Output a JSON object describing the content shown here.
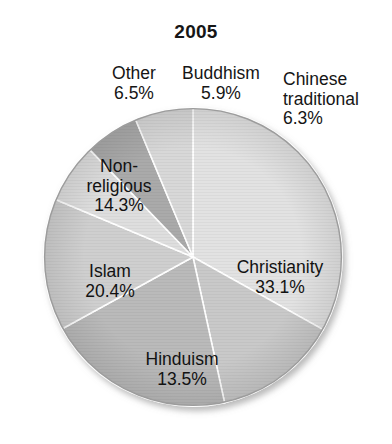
{
  "chart": {
    "title": "2005"
  },
  "chart_data": {
    "type": "pie",
    "title": "2005",
    "xlabel": "",
    "ylabel": "",
    "legend_position": "none",
    "grid": false,
    "units": "percent",
    "start_angle_deg": 0,
    "direction": "clockwise",
    "categories": [
      "Christianity",
      "Hinduism",
      "Islam",
      "Non-religious",
      "Other",
      "Buddhism",
      "Chinese traditional"
    ],
    "values": [
      33.1,
      13.5,
      20.4,
      14.3,
      6.5,
      5.9,
      6.3
    ],
    "slices": [
      {
        "label": "Christianity",
        "value": 33.1,
        "value_text": "33.1%",
        "color": "#e2e2e2",
        "label_position": "inside",
        "label_lines": [
          "Christianity",
          "33.1%"
        ]
      },
      {
        "label": "Hinduism",
        "value": 13.5,
        "value_text": "13.5%",
        "color": "#c9c9c9",
        "label_position": "inside",
        "label_lines": [
          "Hinduism",
          "13.5%"
        ]
      },
      {
        "label": "Islam",
        "value": 20.4,
        "value_text": "20.4%",
        "color": "#bababa",
        "label_position": "inside",
        "label_lines": [
          "Islam",
          "20.4%"
        ]
      },
      {
        "label": "Non-religious",
        "value": 14.3,
        "value_text": "14.3%",
        "color": "#cfcfcf",
        "label_position": "inside",
        "label_lines": [
          "Non-",
          "religious",
          "14.3%"
        ]
      },
      {
        "label": "Other",
        "value": 6.5,
        "value_text": "6.5%",
        "color": "#dedede",
        "label_position": "outside",
        "label_lines": [
          "Other",
          "6.5%"
        ]
      },
      {
        "label": "Buddhism",
        "value": 5.9,
        "value_text": "5.9%",
        "color": "#aaaaaa",
        "label_position": "outside",
        "label_lines": [
          "Buddhism",
          "5.9%"
        ]
      },
      {
        "label": "Chinese traditional",
        "value": 6.3,
        "value_text": "6.3%",
        "color": "#d8d8d8",
        "label_position": "outside",
        "label_lines": [
          "Chinese",
          "traditional",
          "6.3%"
        ]
      }
    ]
  },
  "labels": {
    "other": {
      "line1": "Other",
      "line2": "6.5%"
    },
    "buddhism": {
      "line1": "Buddhism",
      "line2": "5.9%"
    },
    "chinese": {
      "line1": "Chinese",
      "line2": "traditional",
      "line3": "6.3%"
    },
    "nonreligious": {
      "line1": "Non-",
      "line2": "religious",
      "line3": "14.3%"
    },
    "islam": {
      "line1": "Islam",
      "line2": "20.4%"
    },
    "hinduism": {
      "line1": "Hinduism",
      "line2": "13.5%"
    },
    "christianity": {
      "line1": "Christianity",
      "line2": "33.1%"
    }
  },
  "geometry": {
    "center_x": 193,
    "center_y": 257,
    "radius": 149
  },
  "colors": {
    "background": "#ffffff",
    "text": "#151515",
    "slice_border": "#ffffff",
    "pie_outline": "#9a9a9a"
  }
}
